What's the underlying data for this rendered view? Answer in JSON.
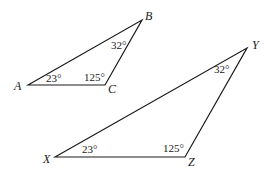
{
  "diagram": {
    "type": "similar-triangles",
    "triangles": [
      {
        "name": "ABC",
        "vertices": [
          {
            "label": "A",
            "x": 28,
            "y": 85,
            "label_x": 14,
            "label_y": 90,
            "angle": "23°",
            "angle_x": 46,
            "angle_y": 82
          },
          {
            "label": "B",
            "x": 142,
            "y": 20,
            "label_x": 145,
            "label_y": 20,
            "angle": "32°",
            "angle_x": 111,
            "angle_y": 49
          },
          {
            "label": "C",
            "x": 105,
            "y": 85,
            "label_x": 108,
            "label_y": 93,
            "angle": "125°",
            "angle_x": 84,
            "angle_y": 81
          }
        ]
      },
      {
        "name": "XYZ",
        "vertices": [
          {
            "label": "X",
            "x": 55,
            "y": 157,
            "label_x": 43,
            "label_y": 163,
            "angle": "23°",
            "angle_x": 82,
            "angle_y": 153
          },
          {
            "label": "Y",
            "x": 247,
            "y": 48,
            "label_x": 252,
            "label_y": 49,
            "angle": "32°",
            "angle_x": 214,
            "angle_y": 73
          },
          {
            "label": "Z",
            "x": 185,
            "y": 157,
            "label_x": 188,
            "label_y": 166,
            "angle": "125°",
            "angle_x": 163,
            "angle_y": 152
          }
        ]
      }
    ]
  }
}
